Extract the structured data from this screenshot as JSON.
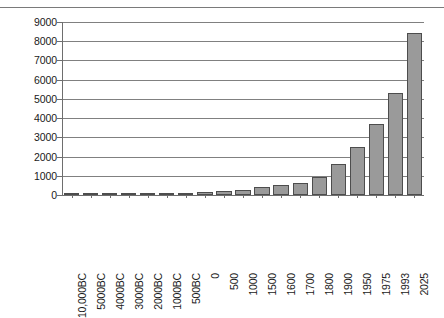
{
  "chart_data": {
    "type": "bar",
    "title": "",
    "xlabel": "",
    "ylabel": "",
    "ylim": [
      0,
      9000
    ],
    "ytick_step": 1000,
    "grid": true,
    "legend": false,
    "bar_color": "#9a9a9a",
    "bar_border_color": "#4d4d4d",
    "categories": [
      "10,000BC",
      "5000BC",
      "4000BC",
      "3000BC",
      "2000BC",
      "1000BC",
      "500BC",
      "0",
      "500",
      "1000",
      "1500",
      "1600",
      "1700",
      "1800",
      "1900",
      "1950",
      "1975",
      "1993",
      "2025"
    ],
    "values": [
      1,
      5,
      7,
      14,
      27,
      50,
      100,
      170,
      190,
      265,
      425,
      545,
      600,
      950,
      1600,
      2500,
      3700,
      5300,
      8430
    ],
    "yticks": [
      "0",
      "1000",
      "2000",
      "3000",
      "4000",
      "5000",
      "6000",
      "7000",
      "8000",
      "9000"
    ],
    "ytick_values": [
      0,
      1000,
      2000,
      3000,
      4000,
      5000,
      6000,
      7000,
      8000,
      9000
    ]
  }
}
